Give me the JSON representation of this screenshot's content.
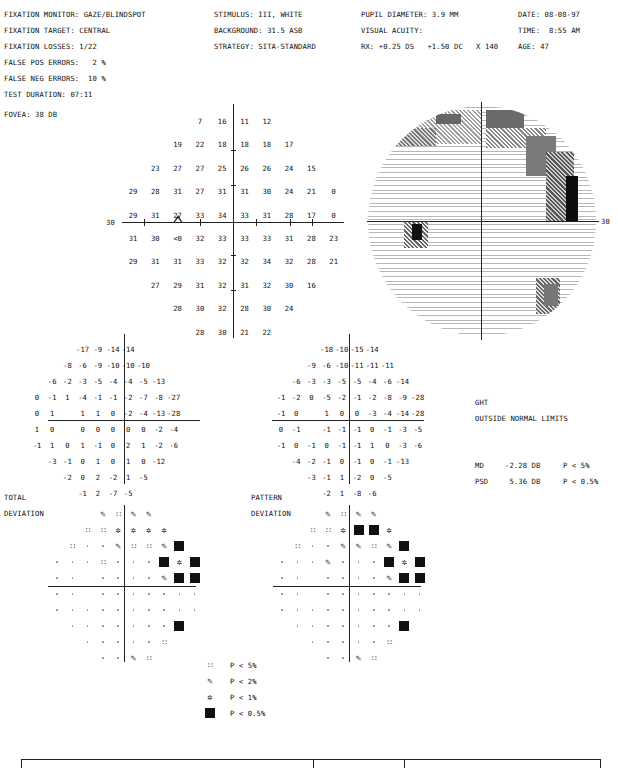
{
  "header": {
    "col1": [
      "FIXATION MONITOR: GAZE/BLINDSPOT",
      "FIXATION TARGET: CENTRAL",
      "FIXATION LOSSES: 1/22",
      "FALSE POS ERRORS:   2 %",
      "FALSE NEG ERRORS:  10 %",
      "TEST DURATION: 07:11"
    ],
    "fovea": "FOVEA: 38 DB",
    "col2": [
      "STIMULUS: III, WHITE",
      "BACKGROUND: 31.5 ASB",
      "STRATEGY: SITA-STANDARD"
    ],
    "col3": [
      "PUPIL DIAMETER: 3.9 MM",
      "VISUAL ACUITY:",
      "RX: +0.25 DS   +1.50 DC   X 140"
    ],
    "col4": [
      "DATE: 08-08-97",
      "TIME:  8:55 AM",
      "AGE: 47"
    ]
  },
  "sensitivity": {
    "axis_label_left": "30",
    "blindspot_marker": "triangle",
    "rows": [
      [
        null,
        null,
        null,
        "7",
        "16",
        "11",
        "12",
        null,
        null,
        null
      ],
      [
        null,
        null,
        "19",
        "22",
        "18",
        "18",
        "18",
        "17",
        null,
        null
      ],
      [
        null,
        "23",
        "27",
        "27",
        "25",
        "26",
        "26",
        "24",
        "15",
        null
      ],
      [
        "29",
        "28",
        "31",
        "27",
        "31",
        "31",
        "30",
        "24",
        "21",
        "0"
      ],
      [
        "29",
        "31",
        "27",
        "33",
        "34",
        "33",
        "31",
        "28",
        "17",
        "0"
      ],
      [
        "31",
        "30",
        "<0",
        "32",
        "33",
        "33",
        "33",
        "31",
        "28",
        "23"
      ],
      [
        "29",
        "31",
        "31",
        "33",
        "32",
        "32",
        "34",
        "32",
        "28",
        "21"
      ],
      [
        null,
        "27",
        "29",
        "31",
        "32",
        "31",
        "32",
        "30",
        "16",
        null
      ],
      [
        null,
        null,
        "28",
        "30",
        "32",
        "28",
        "30",
        "24",
        null,
        null
      ],
      [
        null,
        null,
        null,
        "28",
        "30",
        "21",
        "22",
        null,
        null,
        null
      ]
    ]
  },
  "greyscale": {
    "axis_label_right": "30"
  },
  "total_deviation": {
    "label_line1": "TOTAL",
    "label_line2": "DEVIATION",
    "values": [
      [
        null,
        null,
        null,
        "-17",
        "-9",
        "-14",
        "-14",
        null,
        null,
        null
      ],
      [
        null,
        null,
        "-8",
        "-6",
        "-9",
        "-10",
        "-10",
        "-10",
        null,
        null
      ],
      [
        null,
        "-6",
        "-2",
        "-3",
        "-5",
        "-4",
        "-4",
        "-5",
        "-13",
        null
      ],
      [
        "0",
        "-1",
        "1",
        "-4",
        "-1",
        "-1",
        "-2",
        "-7",
        "-8",
        "-27"
      ],
      [
        "0",
        "1",
        null,
        "1",
        "1",
        "0",
        "-2",
        "-4",
        "-13",
        "-28"
      ],
      [
        "1",
        "0",
        null,
        "0",
        "0",
        "0",
        "0",
        "0",
        "-2",
        "-4"
      ],
      [
        "-1",
        "1",
        "0",
        "1",
        "-1",
        "0",
        "2",
        "1",
        "-2",
        "-6"
      ],
      [
        null,
        "-3",
        "-1",
        "0",
        "1",
        "0",
        "1",
        "0",
        "-12",
        null
      ],
      [
        null,
        null,
        "-2",
        "0",
        "2",
        "-2",
        "1",
        "-5",
        null,
        null
      ],
      [
        null,
        null,
        null,
        "-1",
        "2",
        "-7",
        "-5",
        null,
        null,
        null
      ]
    ],
    "prob": [
      [
        null,
        null,
        null,
        "p2",
        "p5",
        "p2",
        "p2",
        null,
        null,
        null
      ],
      [
        null,
        null,
        "p5",
        "p5",
        "p1",
        "p1",
        "p1",
        "p1",
        null,
        null
      ],
      [
        null,
        "p5",
        "dot",
        "dot",
        "p2",
        "p5",
        "p5",
        "p2",
        "p05",
        null
      ],
      [
        "dot",
        "dot",
        "dot",
        "p5",
        "dot",
        "dot",
        "dot",
        "p05",
        "p1",
        "p05"
      ],
      [
        "dot",
        "dot",
        null,
        "dot",
        "dot",
        "dot",
        "dot",
        "p2",
        "p05",
        "p05"
      ],
      [
        "dot",
        "dot",
        null,
        "dot",
        "dot",
        "dot",
        "dot",
        "dot",
        "dot",
        "dot"
      ],
      [
        "dot",
        "dot",
        "dot",
        "dot",
        "dot",
        "dot",
        "dot",
        "dot",
        "dot",
        "dot"
      ],
      [
        null,
        "dot",
        "dot",
        "dot",
        "dot",
        "dot",
        "dot",
        "dot",
        "p05",
        null
      ],
      [
        null,
        null,
        "dot",
        "dot",
        "dot",
        "dot",
        "dot",
        "p5",
        null,
        null
      ],
      [
        null,
        null,
        null,
        "dot",
        "dot",
        "p2",
        "p5",
        null,
        null,
        null
      ]
    ]
  },
  "pattern_deviation": {
    "label_line1": "PATTERN",
    "label_line2": "DEVIATION",
    "values": [
      [
        null,
        null,
        null,
        "-18",
        "-10",
        "-15",
        "-14",
        null,
        null,
        null
      ],
      [
        null,
        null,
        "-9",
        "-6",
        "-10",
        "-11",
        "-11",
        "-11",
        null,
        null
      ],
      [
        null,
        "-6",
        "-3",
        "-3",
        "-5",
        "-5",
        "-4",
        "-6",
        "-14",
        null
      ],
      [
        "-1",
        "-2",
        "0",
        "-5",
        "-2",
        "-1",
        "-2",
        "-8",
        "-9",
        "-28"
      ],
      [
        "-1",
        "0",
        null,
        "1",
        "0",
        "0",
        "-3",
        "-4",
        "-14",
        "-28"
      ],
      [
        "0",
        "-1",
        null,
        "-1",
        "-1",
        "-1",
        "0",
        "-1",
        "-3",
        "-5"
      ],
      [
        "-1",
        "0",
        "-1",
        "0",
        "-1",
        "-1",
        "1",
        "0",
        "-3",
        "-6"
      ],
      [
        null,
        "-4",
        "-2",
        "-1",
        "0",
        "-1",
        "0",
        "-1",
        "-13",
        null
      ],
      [
        null,
        null,
        "-3",
        "-1",
        "1",
        "-2",
        "0",
        "-5",
        null,
        null
      ],
      [
        null,
        null,
        null,
        "-2",
        "1",
        "-8",
        "-6",
        null,
        null,
        null
      ]
    ],
    "prob": [
      [
        null,
        null,
        null,
        "p2",
        "p5",
        "p2",
        "p2",
        null,
        null,
        null
      ],
      [
        null,
        null,
        "p5",
        "p5",
        "p1",
        "p05",
        "p05",
        "p1",
        null,
        null
      ],
      [
        null,
        "p5",
        "dot",
        "dot",
        "p2",
        "p2",
        "p5",
        "p2",
        "p05",
        null
      ],
      [
        "dot",
        "dot",
        "dot",
        "p2",
        "dot",
        "dot",
        "dot",
        "p05",
        "p1",
        "p05"
      ],
      [
        "dot",
        "dot",
        null,
        "dot",
        "dot",
        "dot",
        "dot",
        "p2",
        "p05",
        "p05"
      ],
      [
        "dot",
        "dot",
        null,
        "dot",
        "dot",
        "dot",
        "dot",
        "dot",
        "dot",
        "dot"
      ],
      [
        "dot",
        "dot",
        "dot",
        "dot",
        "dot",
        "dot",
        "dot",
        "dot",
        "dot",
        "dot"
      ],
      [
        null,
        "dot",
        "dot",
        "dot",
        "dot",
        "dot",
        "dot",
        "dot",
        "p05",
        null
      ],
      [
        null,
        null,
        "dot",
        "dot",
        "dot",
        "dot",
        "dot",
        "p5",
        null,
        null
      ],
      [
        null,
        null,
        null,
        "dot",
        "dot",
        "p2",
        "p5",
        null,
        null,
        null
      ]
    ]
  },
  "ght": {
    "label": "GHT",
    "result": "OUTSIDE NORMAL LIMITS"
  },
  "indices": [
    {
      "name": "MD",
      "value": "-2.28 DB",
      "p": "P < 5%"
    },
    {
      "name": "PSD",
      "value": " 5.36 DB",
      "p": "P < 0.5%"
    }
  ],
  "legend": [
    {
      "symbol": "p5",
      "label": "P < 5%"
    },
    {
      "symbol": "p2",
      "label": "P < 2%"
    },
    {
      "symbol": "p1",
      "label": "P < 1%"
    },
    {
      "symbol": "p05",
      "label": "P < 0.5%"
    }
  ],
  "symbols": {
    "p5": "::",
    "p2": "✎",
    "p1": "✲"
  }
}
